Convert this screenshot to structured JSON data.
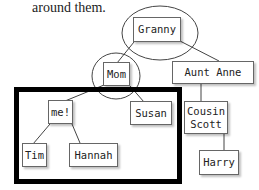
{
  "caption": "around them.",
  "tree": {
    "nodes": {
      "granny": "Granny",
      "mom": "Mom",
      "aunt_anne": "Aunt Anne",
      "me": "me!",
      "susan": "Susan",
      "tim": "Tim",
      "hannah": "Hannah",
      "cousin_scott": "Cousin\nScott",
      "harry": "Harry"
    },
    "edges": [
      [
        "Granny",
        "Mom"
      ],
      [
        "Granny",
        "Aunt Anne"
      ],
      [
        "Mom",
        "me!"
      ],
      [
        "Mom",
        "Susan"
      ],
      [
        "me!",
        "Tim"
      ],
      [
        "me!",
        "Hannah"
      ],
      [
        "Aunt Anne",
        "Cousin Scott"
      ],
      [
        "Cousin Scott",
        "Harry"
      ]
    ],
    "highlighted_circles": [
      "Granny",
      "Mom"
    ],
    "highlighted_subtree": "me! and siblings (me!, Susan, Tim, Hannah)"
  }
}
